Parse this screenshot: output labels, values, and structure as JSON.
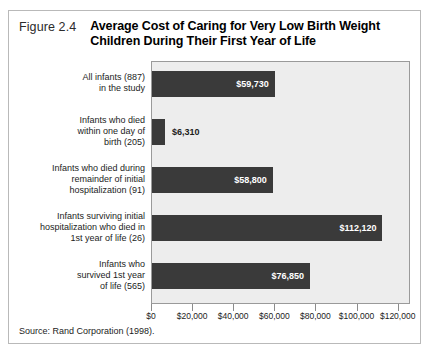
{
  "figure": {
    "number": "Figure 2.4",
    "title_line1": "Average Cost of Caring for Very Low Birth Weight",
    "title_line2": "Children During Their First Year of Life",
    "source": "Source: Rand Corporation (1998)."
  },
  "colors": {
    "bar": "#3a3a3a",
    "plot_background": "#ededed",
    "plot_border": "#9a9a9a",
    "frame_border": "#b9b9b9",
    "page_background": "#ffffff",
    "label_text": "#1c1c1c",
    "value_text_inside": "#ffffff"
  },
  "chart_data": {
    "type": "bar",
    "orientation": "horizontal",
    "title": "Average Cost of Caring for Very Low Birth Weight Children During Their First Year of Life",
    "xlabel": "",
    "ylabel": "",
    "xlim": [
      0,
      126000
    ],
    "xticks": [
      0,
      20000,
      40000,
      60000,
      80000,
      100000,
      120000
    ],
    "xtick_labels": [
      "$0",
      "$20,000",
      "$40,000",
      "$60,000",
      "$80,000",
      "$100,000",
      "$120,000"
    ],
    "grid": false,
    "legend": "none",
    "categories": [
      "All infants (887) in the study",
      "Infants who died within one day of birth (205)",
      "Infants who died during remainder of initial hospitalization (91)",
      "Infants surviving initial hospitalization who died in 1st year of life (26)",
      "Infants who survived 1st year of life (565)"
    ],
    "values": [
      59730,
      6310,
      58800,
      112120,
      76850
    ],
    "value_labels": [
      "$59,730",
      "$6,310",
      "$58,800",
      "$112,120",
      "$76,850"
    ],
    "category_lines": [
      [
        "All infants (887)",
        "in the study"
      ],
      [
        "Infants who died",
        "within one day of",
        "birth (205)"
      ],
      [
        "Infants who died during",
        "remainder of initial",
        "hospitalization (91)"
      ],
      [
        "Infants surviving initial",
        "hospitalization who died in",
        "1st year of life (26)"
      ],
      [
        "Infants who",
        "survived 1st year",
        "of life (565)"
      ]
    ],
    "label_placement": [
      "inside",
      "outside",
      "inside",
      "inside",
      "inside"
    ]
  }
}
